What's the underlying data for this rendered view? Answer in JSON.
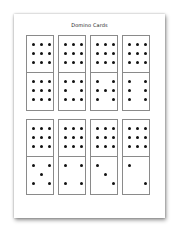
{
  "title": "Domino Cards",
  "colors": {
    "pip": "#111111",
    "border": "#8a8a8a",
    "page": "#ffffff"
  },
  "rows": [
    {
      "cards": [
        {
          "top": 9,
          "bottom": 9
        },
        {
          "top": 9,
          "bottom": 8
        },
        {
          "top": 9,
          "bottom": 7
        },
        {
          "top": 9,
          "bottom": 6
        }
      ]
    },
    {
      "cards": [
        {
          "top": 9,
          "bottom": 5
        },
        {
          "top": 9,
          "bottom": 4
        },
        {
          "top": 9,
          "bottom": 3
        },
        {
          "top": 9,
          "bottom": 2
        }
      ]
    }
  ]
}
